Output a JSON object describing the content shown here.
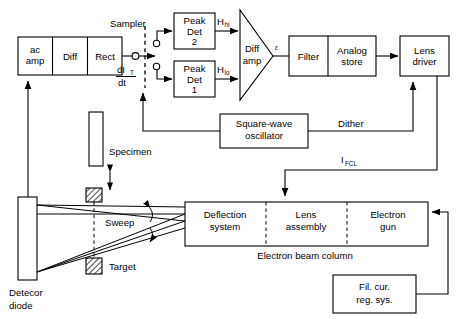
{
  "figure": {
    "type": "block-diagram",
    "title_visible": false
  },
  "blocks": {
    "ac_amp_line1": "ac",
    "ac_amp_line2": "amp",
    "diff": "Diff",
    "rect": "Rect",
    "peak_det2_l1": "Peak",
    "peak_det2_l2": "Det",
    "peak_det2_l3": "2",
    "peak_det1_l1": "Peak",
    "peak_det1_l2": "Det",
    "peak_det1_l3": "1",
    "diff_amp_l1": "Diff",
    "diff_amp_l2": "amp",
    "filter": "Filter",
    "analog_store_l1": "Analog",
    "analog_store_l2": "store",
    "lens_driver_l1": "Lens",
    "lens_driver_l2": "driver",
    "sq_osc_l1": "Square-wave",
    "sq_osc_l2": "oscillator",
    "deflection_l1": "Deflection",
    "deflection_l2": "system",
    "lens_asm_l1": "Lens",
    "lens_asm_l2": "assembly",
    "electron_gun_l1": "Electron",
    "electron_gun_l2": "gun",
    "fil_cur_l1": "Fil. cur.",
    "fil_cur_l2": "reg. sys."
  },
  "labels": {
    "sampler": "Sampler",
    "dit_num": "dI",
    "dit_num_sub": "T",
    "dit_den": "dt",
    "h_hi": "H",
    "h_hi_sub": "hi",
    "h_lo": "H",
    "h_lo_sub": "lo",
    "epsilon": "ε",
    "dither": "Dither",
    "i_fcl": "I",
    "i_fcl_sub": "FCL",
    "specimen": "Specimen",
    "sweep": "Sweep",
    "target": "Target",
    "detector_l1": "Detecor",
    "detector_l2": "diode",
    "electron_beam_column": "Electron beam  column"
  },
  "colors": {
    "stroke": "#000000",
    "fill": "#ffffff",
    "background": "#ffffff"
  }
}
